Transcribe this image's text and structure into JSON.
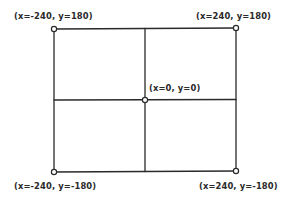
{
  "diagram": {
    "type": "coordinate-grid",
    "stroke_color": "#2a2a2a",
    "points": [
      {
        "id": "top-left",
        "label": "(x=-240, y=180)",
        "x": -240,
        "y": 180
      },
      {
        "id": "top-right",
        "label": "(x=240, y=180)",
        "x": 240,
        "y": 180
      },
      {
        "id": "center",
        "label": "(x=0, y=0)",
        "x": 0,
        "y": 0
      },
      {
        "id": "bottom-left",
        "label": "(x=-240, y=-180)",
        "x": -240,
        "y": -180
      },
      {
        "id": "bottom-right",
        "label": "(x=240, y=-180)",
        "x": 240,
        "y": -180
      }
    ]
  }
}
